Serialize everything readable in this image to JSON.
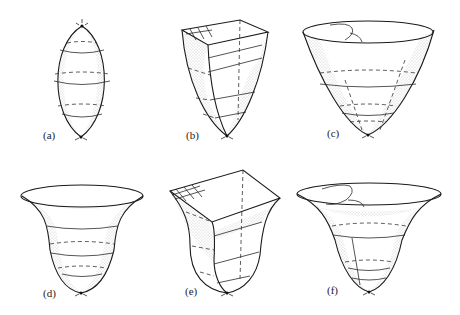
{
  "figure": {
    "panels": [
      {
        "id": "a",
        "label": "(a)",
        "shape": "closed-ellipsoid"
      },
      {
        "id": "b",
        "label": "(b)",
        "shape": "square-top-paraboloid"
      },
      {
        "id": "c",
        "label": "(c)",
        "shape": "open-paraboloid-bowl"
      },
      {
        "id": "d",
        "label": "(d)",
        "shape": "flared-trumpet-bowl"
      },
      {
        "id": "e",
        "label": "(e)",
        "shape": "flared-square-top-bowl"
      },
      {
        "id": "f",
        "label": "(f)",
        "shape": "flared-open-bowl-with-loops"
      }
    ],
    "colors": {
      "line": "#1a1a1a",
      "background": "#ffffff"
    }
  }
}
